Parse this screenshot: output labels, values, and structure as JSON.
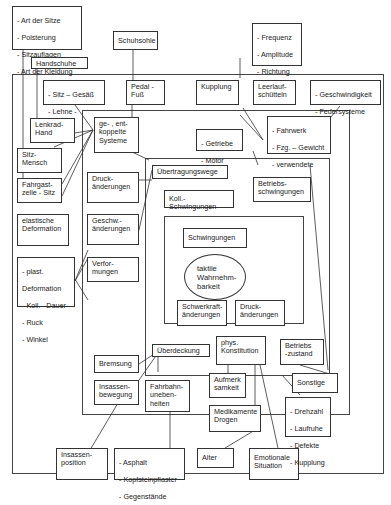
{
  "diagram": {
    "outer_boxes": {
      "sitz_attributes": [
        "- Art der Sitze",
        "- Polsterung",
        "- Sitzauflagen",
        "- Art der Kleidung"
      ],
      "schuhsohle": "Schuhsohle",
      "handschuhe": "Handschuhe",
      "frequency_attrs": [
        "- Frequenz",
        "- Amplitude",
        "- Richtung",
        "- Zeitstruktur"
      ]
    },
    "frame1_boxes": {
      "sitz_gesaess": [
        "- Sitz – Gesäß",
        "- Lehne - Rücken"
      ],
      "pedal_fuss": "Pedal -\nFuß",
      "kupplung": "Kupplung",
      "leerlauf": "Leerlauf-\nschütteln",
      "geschwindigkeit": [
        "- Geschwindigkeit",
        "- Federsysteme"
      ],
      "lenkrad_hand": "Lenkrad-\nHand",
      "sitz_mensch": "Sitz-\nMensch",
      "fahrgastzelle": "Fahrgast-\nzelle - Sitz",
      "elastische_deformation": "elastische\nDeformation",
      "plast_deformation": [
        "- plast.",
        "Deformation",
        "- Koll. –Dauer",
        "- Ruck",
        "- Winkel"
      ],
      "insassenposition": "Insassen-\nposition",
      "asphalt": [
        "- Asphalt",
        "- Kopfsteinpflaster",
        "- Gegenstände"
      ],
      "alter": "Alter",
      "emotionale_situation": "Emotionale\nSituation"
    },
    "frame2_boxes": {
      "gekoppelte_systeme": "ge- , ent-\nkoppelte\nSysteme",
      "getriebe_motor": [
        "- Getriebe",
        "- Motor"
      ],
      "fahrwerk": [
        "- Fahrwerk",
        "- Fzg. – Gewicht",
        "- verwendete",
        "Materialien"
      ],
      "betriebsschwingungen": "Betriebs-\nschwingungen",
      "druckaenderungen_outer": "Druck-\nänderungen",
      "geschw_aenderungen": "Geschw.-\nänderungen",
      "verformungen": "Verfor-\nmungen",
      "bremsung": "Bremsung",
      "insassenbewegung": "Insassen-\nbewegung",
      "fahrbahnunebenheiten": "Fahrbahn-\nuneben-\nheiten",
      "aufmerksamkeit": "Aufmerk\nsamkeit",
      "medikamente": "Medikamente\nDrogen",
      "sonstige": "Sonstige",
      "drehzahl": [
        "- Drehzahl",
        "- Laufruhe",
        "- Defekte",
        "- Kupplung"
      ]
    },
    "frame3_boxes": {
      "uebertragungswege": "Übertragungswege",
      "koll_schwingungen": "Koll.- Schwingungen",
      "ueberdeckung": "Überdeckung",
      "phys_konstitution": "phys.\nKonstitution",
      "betriebszustand": "Betriebs\n-zustand"
    },
    "frame4_boxes": {
      "schwingungen": "Schwingungen",
      "taktile": "taktile\nWahrnehm-\nbarkeit",
      "schwerkraft": "Schwerkraft-\nänderungen",
      "druckaenderungen_inner": "Druck-\nänderungen"
    }
  }
}
